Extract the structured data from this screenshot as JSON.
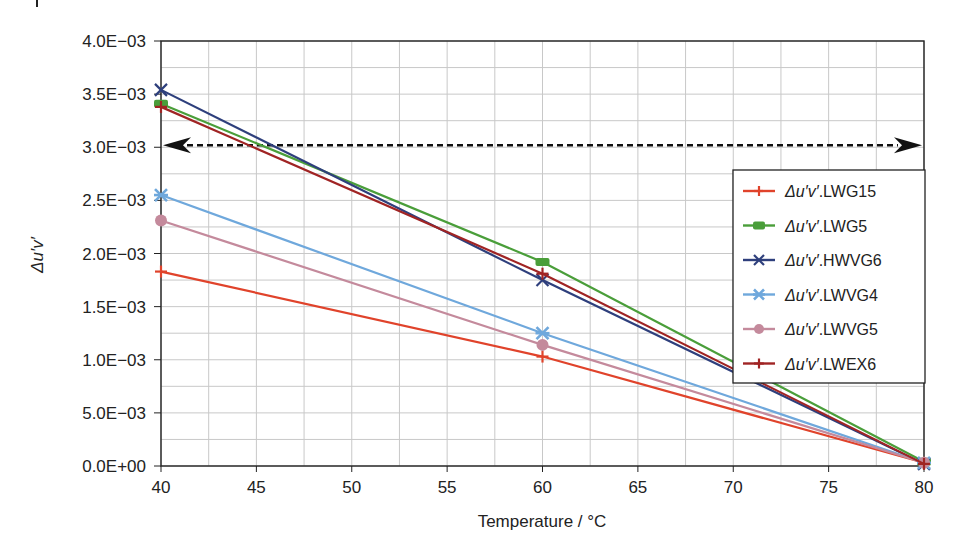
{
  "chart_data": {
    "type": "line",
    "title": "",
    "xlabel": "Temperature / °C",
    "ylabel": "Δu′v′",
    "xlim": [
      40,
      80
    ],
    "ylim": [
      0,
      0.004
    ],
    "x_ticks": [
      "40",
      "45",
      "50",
      "55",
      "60",
      "65",
      "70",
      "75",
      "80"
    ],
    "y_ticks": [
      "0.0E+00",
      "5.0E−03",
      "1.0E−03",
      "1.5E−03",
      "2.0E−03",
      "2.5E−03",
      "3.0E−03",
      "3.5E−03",
      "4.0E−03"
    ],
    "grid": true,
    "legend_position": "right-center inside",
    "x": [
      40,
      60,
      80
    ],
    "series": [
      {
        "name": "Δu′v′.LWG15",
        "color": "#e0432b",
        "marker": "plus",
        "values": [
          0.00183,
          0.00103,
          3e-05
        ]
      },
      {
        "name": "Δu′v′.LWG5",
        "color": "#4a9e3a",
        "marker": "square",
        "values": [
          0.00341,
          0.00192,
          4e-05
        ]
      },
      {
        "name": "Δu′v′.HWVG6",
        "color": "#2e3f7c",
        "marker": "x",
        "values": [
          0.00354,
          0.00175,
          2e-05
        ]
      },
      {
        "name": "Δu′v′.LWVG4",
        "color": "#6fa8dc",
        "marker": "star",
        "values": [
          0.00255,
          0.00125,
          3e-05
        ]
      },
      {
        "name": "Δu′v′.LWVG5",
        "color": "#c48a9c",
        "marker": "circle",
        "values": [
          0.00231,
          0.00114,
          3e-05
        ]
      },
      {
        "name": "Δu′v′.LWEX6",
        "color": "#a02424",
        "marker": "plus",
        "values": [
          0.00338,
          0.00181,
          2e-05
        ]
      }
    ],
    "annotations": [
      {
        "type": "double-arrow",
        "style": "dashed",
        "from": [
          40,
          0.00302
        ],
        "to": [
          80,
          0.00302
        ]
      }
    ]
  }
}
